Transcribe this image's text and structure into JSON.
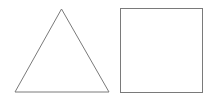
{
  "canvas": {
    "width": 212,
    "height": 98,
    "background": "#ffffff"
  },
  "shapes": [
    {
      "type": "triangle",
      "points": [
        [
          61.5,
          9
        ],
        [
          15,
          92
        ],
        [
          109,
          92
        ]
      ],
      "stroke": "#7a7a7a",
      "fill": "none",
      "stroke_width": 1
    },
    {
      "type": "square",
      "x": 120.5,
      "y": 8.5,
      "width": 82,
      "height": 84,
      "stroke": "#7a7a7a",
      "fill": "none",
      "stroke_width": 1
    }
  ]
}
